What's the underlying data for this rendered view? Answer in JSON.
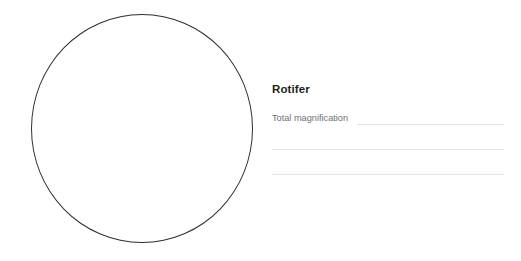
{
  "worksheet": {
    "specimen_title": "Rotifer",
    "drawing_area": {
      "shape": "circle",
      "name": "microscope-field-of-view"
    },
    "fields": [
      {
        "label": "Total magnification",
        "value": "",
        "has_rule": true
      },
      {
        "label": "",
        "value": "",
        "has_rule": true
      },
      {
        "label": "",
        "value": "",
        "has_rule": true
      }
    ],
    "colors": {
      "background": "#ffffff",
      "circle_stroke": "#2e2e33",
      "title_text": "#231f20",
      "label_text": "#6f6f75",
      "rule_line": "#e4e4ea"
    }
  }
}
